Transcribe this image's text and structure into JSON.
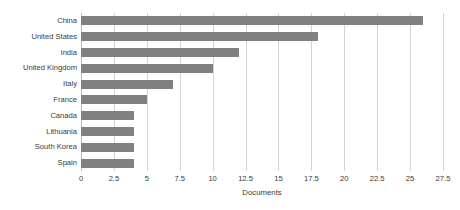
{
  "chart_data": {
    "type": "bar",
    "orientation": "horizontal",
    "title": "",
    "subtitle": "",
    "xlabel": "Documents",
    "ylabel": "",
    "categories": [
      "China",
      "United States",
      "India",
      "United Kingdom",
      "Italy",
      "France",
      "Canada",
      "Lithuania",
      "South Korea",
      "Spain"
    ],
    "values": [
      26,
      18,
      12,
      10,
      7,
      5,
      4,
      4,
      4,
      4
    ],
    "xlim": [
      0,
      27.5
    ],
    "xticks": [
      0,
      2.5,
      5,
      7.5,
      10,
      12.5,
      15,
      17.5,
      20,
      22.5,
      25,
      27.5
    ],
    "xtick_labels": [
      "0",
      "2.5",
      "5",
      "7.5",
      "10",
      "12.5",
      "15",
      "17.5",
      "20",
      "22.5",
      "25",
      "27.5"
    ],
    "grid": "vertical",
    "legend": "none",
    "bar_color": "#808080",
    "gridline_color": "#d4d4d4",
    "axis_color": "#bdbdbd",
    "background_color": "#ffffff",
    "text_color": "#3a3a3a"
  }
}
